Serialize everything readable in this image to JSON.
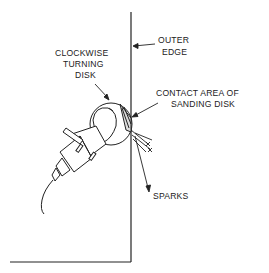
{
  "diagram": {
    "labels": {
      "outer_edge": [
        "OUTER",
        "EDGE"
      ],
      "clockwise_disk": [
        "CLOCKWISE",
        "TURNING",
        "DISK"
      ],
      "contact_area": [
        "CONTACT AREA OF",
        "SANDING DISK"
      ],
      "sparks": "SPARKS"
    },
    "colors": {
      "line": "#222222",
      "background": "#ffffff"
    }
  }
}
